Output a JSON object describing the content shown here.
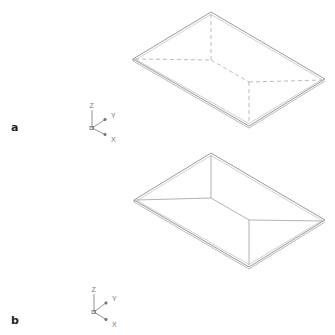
{
  "figure": {
    "panels": [
      {
        "id": "a",
        "label": "a",
        "roof_style": "hip roof, hidden edges dashed",
        "edge_style": "dashed",
        "axis_labels": {
          "z": "Z",
          "y": "Y",
          "x": "X"
        }
      },
      {
        "id": "b",
        "label": "b",
        "roof_style": "hip roof, edges solid",
        "edge_style": "solid",
        "axis_labels": {
          "z": "Z",
          "y": "Y",
          "x": "X"
        }
      }
    ],
    "colors": {
      "outline": "#9a9a9a",
      "inner_edges": "#b0b0b0",
      "label": "#222222",
      "axis": "#777777"
    }
  }
}
